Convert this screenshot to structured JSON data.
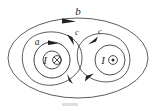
{
  "figure": {
    "background_color": "#ffffff",
    "stroke_color": "#4a4a4a",
    "width": 156,
    "height": 111,
    "labels": {
      "outer_loop": "b",
      "inner_loop": "a",
      "figure_eight_left": "c",
      "figure_eight_right": "c",
      "current_left": "I",
      "current_right": "I"
    },
    "currents": [
      {
        "label": "I",
        "symbol": "into-page",
        "glyph": "⊗",
        "side": "left",
        "cx": 52,
        "cy": 60
      },
      {
        "label": "I",
        "symbol": "out-of-page",
        "glyph": "⊙",
        "side": "right",
        "cx": 110,
        "cy": 60
      }
    ],
    "loops": [
      {
        "name": "a",
        "shape": "circle",
        "encloses": "left current only",
        "direction": "counterclockwise-arrow-at-top"
      },
      {
        "name": "b",
        "shape": "ellipse",
        "encloses": "both currents",
        "direction": "clockwise-arrow-at-top"
      },
      {
        "name": "c",
        "shape": "figure-eight",
        "encloses": "both currents with crossing",
        "direction": "arrows-near-crossing"
      }
    ],
    "caption": ""
  }
}
